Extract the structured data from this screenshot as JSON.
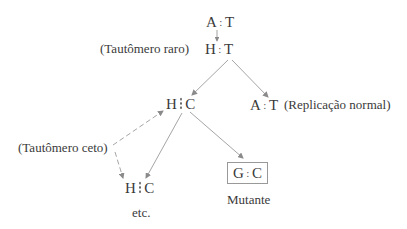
{
  "diagram": {
    "nodes": {
      "root": {
        "left": "A",
        "right": "T",
        "separator": ":"
      },
      "rare_tautomer": {
        "left": "H",
        "right": "T",
        "separator": ":",
        "label": "(Tautômero raro)"
      },
      "hc_middle": {
        "left": "H",
        "right": "C",
        "separator": "dotted"
      },
      "normal": {
        "left": "A",
        "right": "T",
        "separator": ":",
        "label": "(Replicação normal)"
      },
      "keto_label": "(Tautômero ceto)",
      "hc_bottom": {
        "left": "H",
        "right": "C",
        "separator": "dotted"
      },
      "mutant": {
        "left": "G",
        "right": "C",
        "separator": ":",
        "label": "Mutante",
        "boxed": true
      },
      "etc": "etc."
    },
    "edges": [
      {
        "from": "root",
        "to": "rare_tautomer",
        "style": "arrow-small"
      },
      {
        "from": "rare_tautomer",
        "to": "hc_middle",
        "style": "solid-arrow"
      },
      {
        "from": "rare_tautomer",
        "to": "normal",
        "style": "solid-arrow"
      },
      {
        "from": "keto_label",
        "to": "hc_middle",
        "style": "dashed-arrow"
      },
      {
        "from": "keto_label",
        "to": "hc_bottom",
        "style": "dashed-arrow"
      },
      {
        "from": "hc_middle",
        "to": "hc_bottom",
        "style": "solid-arrow"
      },
      {
        "from": "hc_middle",
        "to": "mutant",
        "style": "solid-arrow"
      }
    ],
    "colors": {
      "line": "#9a9a9a",
      "text": "#3a3a3a",
      "background": "#ffffff"
    }
  }
}
